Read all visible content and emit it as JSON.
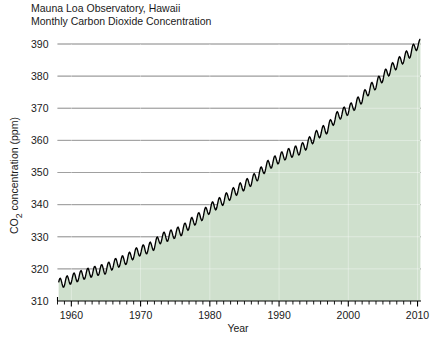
{
  "chart_data": {
    "type": "line",
    "title": "Mauna Loa Observatory, Hawaii\nMonthly Carbon Dioxide Concentration",
    "title_lines": [
      "Mauna Loa Observatory, Hawaii",
      "Monthly Carbon Dioxide Concentration"
    ],
    "xlabel": "Year",
    "ylabel": "CO2 concentration (ppm)",
    "ylabel_parts": {
      "pre": "CO",
      "sub": "2",
      "post": " concentration (ppm)"
    },
    "xlim": [
      1958,
      2010.5
    ],
    "ylim": [
      310,
      390
    ],
    "yticks": [
      310,
      320,
      330,
      340,
      350,
      360,
      370,
      380,
      390
    ],
    "xticks": [
      1960,
      1970,
      1980,
      1990,
      2000,
      2010
    ],
    "x_minor_tick_step": 1,
    "grid": "horizontal",
    "legend": "none",
    "fill_under_curve": true,
    "colors": {
      "line": "#000000",
      "fill": "#cfe0cd",
      "grid": "#555555",
      "axis": "#000000",
      "text": "#1a1a1a",
      "background": "#ffffff"
    },
    "seasonal_amplitude_ppm": 3.1,
    "seasonal_peak_month": 5,
    "series": [
      {
        "name": "Monthly mean CO2 concentration",
        "description": "Keeling Curve annual mean trend, monthly values oscillate seasonally about this trend",
        "x": [
          1958,
          1959,
          1960,
          1961,
          1962,
          1963,
          1964,
          1965,
          1966,
          1967,
          1968,
          1969,
          1970,
          1971,
          1972,
          1973,
          1974,
          1975,
          1976,
          1977,
          1978,
          1979,
          1980,
          1981,
          1982,
          1983,
          1984,
          1985,
          1986,
          1987,
          1988,
          1989,
          1990,
          1991,
          1992,
          1993,
          1994,
          1995,
          1996,
          1997,
          1998,
          1999,
          2000,
          2001,
          2002,
          2003,
          2004,
          2005,
          2006,
          2007,
          2008,
          2009,
          2010
        ],
        "values": [
          315.3,
          315.9,
          316.9,
          317.6,
          318.4,
          319.0,
          319.6,
          320.0,
          321.4,
          322.2,
          323.0,
          324.6,
          325.7,
          326.3,
          327.5,
          329.7,
          330.2,
          331.1,
          332.0,
          333.8,
          335.4,
          336.8,
          338.8,
          340.1,
          341.5,
          343.1,
          344.7,
          346.0,
          347.4,
          349.2,
          351.6,
          353.1,
          354.4,
          355.6,
          356.4,
          357.1,
          358.8,
          360.8,
          362.6,
          363.7,
          366.7,
          368.4,
          369.5,
          371.1,
          373.2,
          375.8,
          377.5,
          379.8,
          381.9,
          383.8,
          385.6,
          387.4,
          389.9
        ]
      }
    ]
  },
  "axis": {
    "ytick_labels": [
      "390",
      "380",
      "370",
      "360",
      "350",
      "340",
      "330",
      "320",
      "310"
    ],
    "xtick_labels": [
      "1960",
      "1970",
      "1980",
      "1990",
      "2000",
      "2010"
    ]
  }
}
